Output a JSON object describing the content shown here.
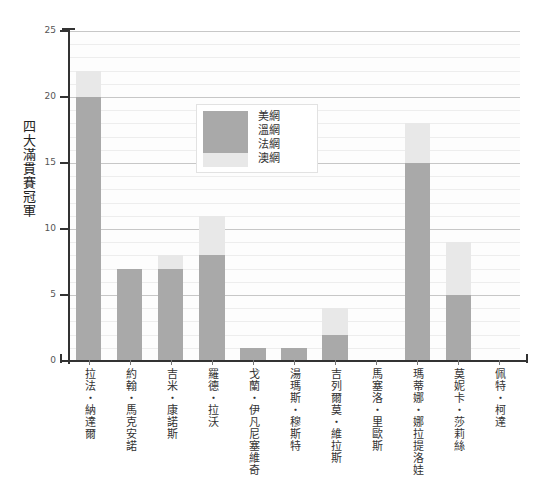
{
  "chart_data": {
    "type": "bar",
    "stacked": true,
    "title": "",
    "xlabel": "",
    "ylabel": "四大滿貫賽冠軍",
    "ylim": [
      0,
      25
    ],
    "yticks": [
      0,
      5,
      10,
      15,
      20,
      25
    ],
    "ytick_labels": [
      "0",
      "5",
      "10",
      "15",
      "20",
      "25"
    ],
    "minor_grid_step": 1,
    "grid": true,
    "legend_position": "upper center",
    "categories": [
      "拉法・納達爾",
      "約翰・馬克安諾",
      "吉米・康諾斯",
      "羅德・拉沃",
      "戈蘭・伊凡尼塞維奇",
      "湯瑪斯・穆斯特",
      "吉列爾莫・維拉斯",
      "馬塞洛・里歐斯",
      "瑪蒂娜・娜拉提洛娃",
      "莫妮卡・莎莉絲",
      "佩特・柯達"
    ],
    "series": [
      {
        "name": "美網",
        "color": "#a9a9a9",
        "values": [
          4,
          4,
          5,
          2,
          1,
          1,
          1,
          0,
          4,
          2,
          0
        ]
      },
      {
        "name": "溫網",
        "color": "#a9a9a9",
        "values": [
          2,
          3,
          2,
          4,
          0,
          0,
          0,
          0,
          9,
          3,
          0
        ]
      },
      {
        "name": "法網",
        "color": "#a9a9a9",
        "values": [
          14,
          0,
          0,
          2,
          0,
          0,
          1,
          0,
          2,
          0,
          0
        ]
      },
      {
        "name": "澳網",
        "color": "#e8e8e8",
        "values": [
          2,
          0,
          1,
          3,
          0,
          0,
          2,
          0,
          3,
          4,
          0
        ]
      }
    ],
    "totals": [
      22,
      7,
      8,
      11,
      1,
      1,
      4,
      0,
      18,
      9,
      0
    ]
  },
  "legend": {
    "items": [
      {
        "label": "美網",
        "color": "#a9a9a9"
      },
      {
        "label": "溫網",
        "color": "#a9a9a9"
      },
      {
        "label": "法網",
        "color": "#a9a9a9"
      },
      {
        "label": "澳網",
        "color": "#e8e8e8"
      }
    ]
  },
  "colors": {
    "bar_dark": "#a9a9a9",
    "bar_light": "#e8e8e8",
    "grid_minor": "#ededed",
    "grid_major": "#9a9a9a",
    "axis": "#333333",
    "background": "#ffffff"
  }
}
